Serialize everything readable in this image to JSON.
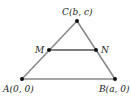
{
  "diagram": {
    "title": "",
    "points": [
      {
        "id": "A",
        "label": "A(0, 0)",
        "x": 22,
        "y": 79,
        "lx": 3,
        "ly": 92
      },
      {
        "id": "B",
        "label": "B(a, 0)",
        "x": 115,
        "y": 79,
        "lx": 99,
        "ly": 92
      },
      {
        "id": "C",
        "label": "C(b, c)",
        "x": 77,
        "y": 21,
        "lx": 62,
        "ly": 15
      },
      {
        "id": "M",
        "label": "M",
        "x": 49,
        "y": 50,
        "lx": 34,
        "ly": 53
      },
      {
        "id": "N",
        "label": "N",
        "x": 96,
        "y": 50,
        "lx": 101,
        "ly": 53
      }
    ],
    "segments": [
      {
        "from": "A",
        "to": "B"
      },
      {
        "from": "A",
        "to": "C"
      },
      {
        "from": "B",
        "to": "C"
      },
      {
        "from": "M",
        "to": "N"
      }
    ],
    "colors": {
      "edge": "#8a8a8a",
      "midsegment": "#555555",
      "point": "#111111"
    }
  }
}
